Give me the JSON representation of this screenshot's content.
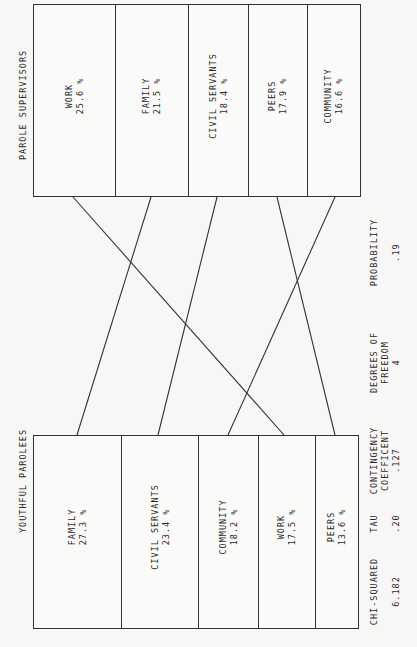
{
  "top_group": {
    "title": "PAROLE SUPERVISORS",
    "cells": [
      {
        "label": "WORK",
        "value": "25.6 %"
      },
      {
        "label": "FAMILY",
        "value": "21.5 %"
      },
      {
        "label": "CIVIL SERVANTS",
        "value": "18.4 %"
      },
      {
        "label": "PEERS",
        "value": "17.9 %"
      },
      {
        "label": "COMMUNITY",
        "value": "16.6 %"
      }
    ]
  },
  "bottom_group": {
    "title": "YOUTHFUL PAROLEES",
    "cells": [
      {
        "label": "FAMILY",
        "value": "27.3 %"
      },
      {
        "label": "CIVIL SERVANTS",
        "value": "23.4 %"
      },
      {
        "label": "COMMUNITY",
        "value": "18.2 %"
      },
      {
        "label": "WORK",
        "value": "17.5 %"
      },
      {
        "label": "PEERS",
        "value": "13.6 %"
      }
    ]
  },
  "stats": [
    {
      "label_line1": "CHI-SQUARED",
      "label_line2": "",
      "value": "6.182"
    },
    {
      "label_line1": "TAU",
      "label_line2": "",
      "value": ".20"
    },
    {
      "label_line1": "CONTINGENCY",
      "label_line2": "COEFFICENT",
      "value": ".127"
    },
    {
      "label_line1": "DEGREES OF",
      "label_line2": "FREEDOM",
      "value": "4"
    },
    {
      "label_line1": "PROBABILITY",
      "label_line2": "",
      "value": ".19"
    }
  ],
  "connections": [
    {
      "category": "WORK",
      "from_rank": 1,
      "to_rank": 4
    },
    {
      "category": "FAMILY",
      "from_rank": 2,
      "to_rank": 1
    },
    {
      "category": "CIVIL SERVANTS",
      "from_rank": 3,
      "to_rank": 2
    },
    {
      "category": "PEERS",
      "from_rank": 4,
      "to_rank": 5
    },
    {
      "category": "COMMUNITY",
      "from_rank": 5,
      "to_rank": 3
    }
  ]
}
